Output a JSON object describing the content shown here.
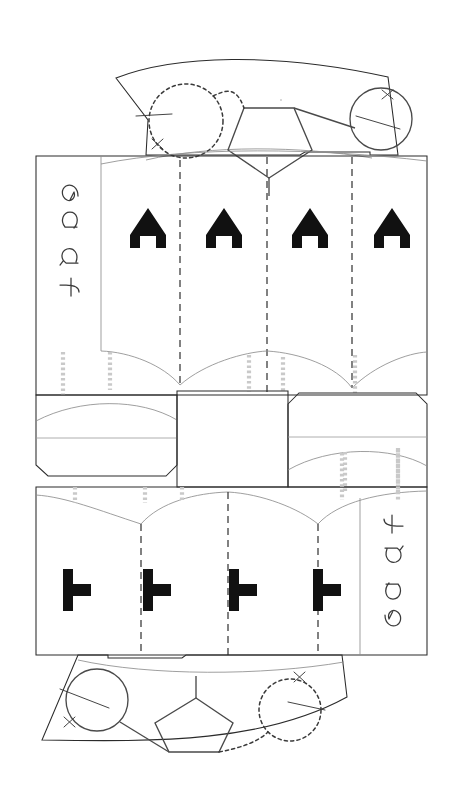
{
  "document": {
    "title": "Papercraft Die-Cut Template",
    "description": "Two-part fan-and-panel cutting template with fold lines, glue tabs and registration marks",
    "background_color": "#ffffff",
    "width": 450,
    "height": 800
  },
  "colors": {
    "cut_line": "#2b2b2b",
    "light_cut_line": "#8e8e8e",
    "score_line": "#9a9a9a",
    "fold_dashed": "#262626",
    "glue_strip": "#c9c9c9",
    "letter_fill": "#111111",
    "handwriting": "#3a3a3a",
    "shape_outline": "#4a4a4a"
  },
  "top_assembly": {
    "name": "top-fan-section",
    "fan": {
      "label": "curved-fan-panel",
      "registration_marks": [
        "x",
        "x"
      ]
    },
    "pentagon": {
      "label": "pentagon-outline",
      "sides": 5
    },
    "dotted_circle": {
      "label": "dashed-circle",
      "style": "dashed"
    },
    "solid_circle": {
      "label": "solid-circle",
      "style": "solid"
    },
    "panel_letters": [
      "A",
      "A",
      "A",
      "A"
    ],
    "handwritten_note": "egg ft",
    "fold_count": 3
  },
  "bottom_assembly": {
    "name": "bottom-fan-section",
    "fan": {
      "label": "curved-fan-panel",
      "registration_marks": [
        "x",
        "x"
      ]
    },
    "pentagon": {
      "label": "pentagon-outline",
      "sides": 5
    },
    "dotted_circle": {
      "label": "dashed-circle",
      "style": "dashed"
    },
    "solid_circle": {
      "label": "solid-circle",
      "style": "solid"
    },
    "panel_letters": [
      "T",
      "T",
      "T",
      "T"
    ],
    "handwritten_note": "egg ft",
    "fold_count": 3
  },
  "middle_tabs": {
    "left_tab": {
      "label": "left-glue-tab",
      "corners": "chamfered"
    },
    "center_tab": {
      "label": "center-rectangular-tab",
      "corners": "square"
    },
    "right_tab": {
      "label": "right-glue-tab",
      "corners": "chamfered"
    }
  },
  "legend": {
    "solid": "cut line",
    "dashed": "fold line",
    "grey_dotted": "glue area"
  }
}
